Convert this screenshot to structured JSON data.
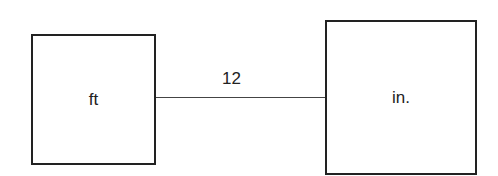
{
  "diagram": {
    "left_box": {
      "label": "ft"
    },
    "right_box": {
      "label": "in."
    },
    "connector": {
      "label": "12"
    }
  }
}
